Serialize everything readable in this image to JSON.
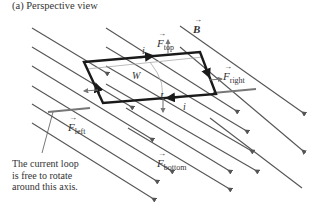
{
  "title": "(a) Perspective view",
  "labels": {
    "field": "B",
    "force_top": {
      "symbol": "F",
      "sub": "top"
    },
    "force_right": {
      "symbol": "F",
      "sub": "right"
    },
    "force_left": {
      "symbol": "F",
      "sub": "left"
    },
    "force_bottom": {
      "symbol": "F",
      "sub": "bottom"
    },
    "current_top": "i",
    "current_bottom": "i",
    "width": "W",
    "length": "L"
  },
  "caption": {
    "line1": "The current loop",
    "line2": "is free to rotate",
    "line3": "around this axis."
  },
  "colors": {
    "field_line": "#555555",
    "loop": "#1a1a1a",
    "axis": "#777777",
    "force_arrow": "#777777",
    "dimension": "#aaaaaa",
    "text": "#333333"
  }
}
